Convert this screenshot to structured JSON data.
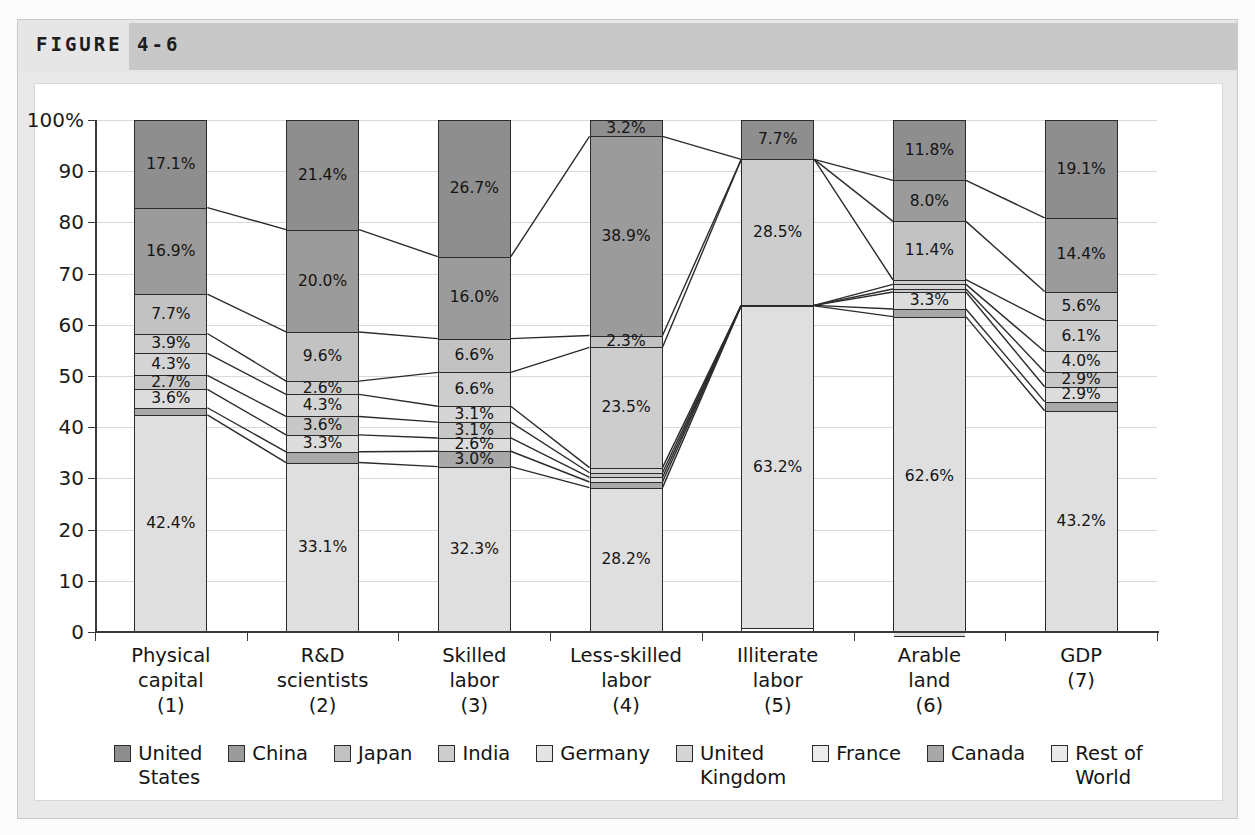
{
  "figure": {
    "label": "FIGURE 4-6"
  },
  "chart_data": {
    "type": "bar",
    "subtype": "stacked-100-percent",
    "title": "",
    "xlabel": "",
    "ylabel": "",
    "ylim": [
      0,
      100
    ],
    "ytick_labels": [
      "0",
      "10",
      "20",
      "30",
      "40",
      "50",
      "60",
      "70",
      "80",
      "90",
      "100%"
    ],
    "ytick_values": [
      0,
      10,
      20,
      30,
      40,
      50,
      60,
      70,
      80,
      90,
      100
    ],
    "grid": true,
    "legend_position": "bottom",
    "categories": [
      "Physical\ncapital\n(1)",
      "R&D\nscientists\n(2)",
      "Skilled\nlabor\n(3)",
      "Less-skilled\nlabor\n(4)",
      "Illiterate\nlabor\n(5)",
      "Arable\nland\n(6)",
      "GDP\n(7)"
    ],
    "series": [
      {
        "name": "United States",
        "color": "#8e8e8e",
        "values": [
          17.1,
          21.4,
          26.7,
          3.2,
          7.7,
          11.8,
          19.1
        ],
        "labels": [
          "17.1%",
          "21.4%",
          "26.7%",
          "3.2%",
          "7.7%",
          "11.8%",
          "19.1%"
        ]
      },
      {
        "name": "China",
        "color": "#9b9b9b",
        "values": [
          16.9,
          20.0,
          16.0,
          38.9,
          0.0,
          8.0,
          14.4
        ],
        "labels": [
          "16.9%",
          "20.0%",
          "16.0%",
          "38.9%",
          "",
          "8.0%",
          "14.4%"
        ]
      },
      {
        "name": "Japan",
        "color": "#c2c2c2",
        "values": [
          7.7,
          9.6,
          6.6,
          2.3,
          0.0,
          11.4,
          5.6
        ],
        "labels": [
          "7.7%",
          "9.6%",
          "6.6%",
          "2.3%",
          "",
          "11.4%",
          "5.6%"
        ]
      },
      {
        "name": "India",
        "color": "#cdcdcd",
        "values": [
          3.9,
          2.6,
          6.6,
          23.5,
          28.5,
          0.9,
          6.1
        ],
        "labels": [
          "3.9%",
          "2.6%",
          "6.6%",
          "23.5%",
          "28.5%",
          "",
          "6.1%"
        ]
      },
      {
        "name": "Germany",
        "color": "#d5d5d5",
        "values": [
          4.3,
          4.3,
          3.1,
          1.0,
          0.0,
          0.9,
          4.0
        ],
        "labels": [
          "4.3%",
          "4.3%",
          "3.1%",
          "",
          "",
          "",
          "4.0%"
        ]
      },
      {
        "name": "United Kingdom",
        "color": "#c7c7c7",
        "values": [
          2.7,
          3.6,
          3.1,
          0.9,
          0.0,
          0.6,
          2.9
        ],
        "labels": [
          "2.7%",
          "3.6%",
          "3.1%",
          "",
          "",
          "",
          "2.9%"
        ]
      },
      {
        "name": "France",
        "color": "#dcdcdc",
        "values": [
          3.6,
          3.3,
          2.6,
          0.9,
          0.0,
          3.3,
          2.9
        ],
        "labels": [
          "3.6%",
          "3.3%",
          "2.6%",
          "",
          "",
          "3.3%",
          "2.9%"
        ]
      },
      {
        "name": "Canada",
        "color": "#a8a8a8",
        "values": [
          1.4,
          2.1,
          3.0,
          1.1,
          0.1,
          1.5,
          1.8
        ],
        "labels": [
          "",
          "",
          "3.0%",
          "",
          "",
          "",
          ""
        ]
      },
      {
        "name": "Rest of World",
        "color": "#dfdfdf",
        "values": [
          42.4,
          33.1,
          32.3,
          28.2,
          63.2,
          62.6,
          43.2
        ],
        "labels": [
          "42.4%",
          "33.1%",
          "32.3%",
          "28.2%",
          "63.2%",
          "62.6%",
          "43.2%"
        ]
      }
    ],
    "legend": [
      {
        "label": "United\nStates",
        "color": "#8e8e8e"
      },
      {
        "label": "China",
        "color": "#9b9b9b"
      },
      {
        "label": "Japan",
        "color": "#c2c2c2"
      },
      {
        "label": "India",
        "color": "#cdcdcd"
      },
      {
        "label": "Germany",
        "color": "#e4e4e4"
      },
      {
        "label": "United\nKingdom",
        "color": "#d5d5d5"
      },
      {
        "label": "France",
        "color": "#ececec"
      },
      {
        "label": "Canada",
        "color": "#a8a8a8"
      },
      {
        "label": "Rest of\nWorld",
        "color": "#e9e9e9"
      }
    ]
  }
}
